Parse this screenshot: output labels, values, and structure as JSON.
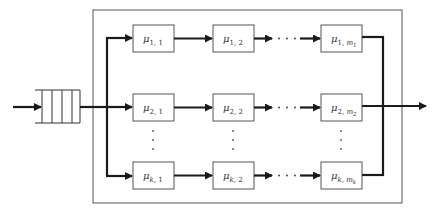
{
  "diagram": {
    "type": "queueing-network",
    "colors": {
      "line": "#1a1a1a",
      "box_border": "#555555",
      "background": "#ffffff"
    },
    "queue": {
      "slots": 4
    },
    "rows": [
      {
        "id": "row-1",
        "stages": [
          {
            "symbol": "μ",
            "sub1": "1",
            "sub2": "1",
            "sub2_sub": ""
          },
          {
            "symbol": "μ",
            "sub1": "1",
            "sub2": "2",
            "sub2_sub": ""
          },
          {
            "symbol": "μ",
            "sub1": "1",
            "sub2": "m",
            "sub2_sub": "1"
          }
        ]
      },
      {
        "id": "row-2",
        "stages": [
          {
            "symbol": "μ",
            "sub1": "2",
            "sub2": "1",
            "sub2_sub": ""
          },
          {
            "symbol": "μ",
            "sub1": "2",
            "sub2": "2",
            "sub2_sub": ""
          },
          {
            "symbol": "μ",
            "sub1": "2",
            "sub2": "m",
            "sub2_sub": "2"
          }
        ]
      },
      {
        "id": "row-k",
        "stages": [
          {
            "symbol": "μ",
            "sub1": "k",
            "sub2": "1",
            "sub2_sub": ""
          },
          {
            "symbol": "μ",
            "sub1": "k",
            "sub2": "2",
            "sub2_sub": ""
          },
          {
            "symbol": "μ",
            "sub1": "k",
            "sub2": "m",
            "sub2_sub": "k"
          }
        ]
      }
    ],
    "ellipsis": {
      "horizontal": "· · ·",
      "vertical": "⋮"
    }
  }
}
